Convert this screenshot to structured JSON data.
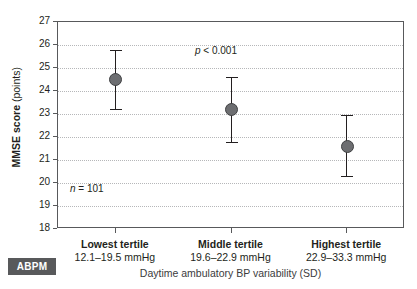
{
  "chart_data": {
    "type": "scatter",
    "title": "",
    "xlabel": "Daytime ambulatory BP variability (SD)",
    "ylabel_strong": "MMSE score",
    "ylabel_light": "(points)",
    "ylabel_full": "MMSE score (points)",
    "ylim": [
      18,
      27
    ],
    "yticks": [
      27,
      26,
      25,
      24,
      23,
      22,
      21,
      20,
      19,
      18
    ],
    "grid": true,
    "legend": "none",
    "categories": [
      "Lowest tertile",
      "Middle tertile",
      "Highest tertile"
    ],
    "category_ranges": [
      "12.1–19.5 mmHg",
      "19.6–22.9 mmHg",
      "22.9–33.3 mmHg"
    ],
    "series": [
      {
        "name": "MMSE score",
        "values": [
          24.5,
          23.2,
          21.6
        ],
        "ci_lower": [
          23.2,
          21.8,
          20.3
        ],
        "ci_upper": [
          25.8,
          24.6,
          22.95
        ],
        "marker": "filled-circle",
        "color": "#6d6e71"
      }
    ],
    "annotations": [
      {
        "id": "pvalue",
        "text_italic": "p",
        "text_rest": " < 0.001"
      },
      {
        "id": "sample-size",
        "text_italic": "n",
        "text_rest": " = 101"
      }
    ]
  },
  "badge": {
    "label": "ABPM",
    "background": "#58595b",
    "text_color": "#ffffff"
  },
  "colors": {
    "marker": "#6d6e71",
    "marker_edge": "#3f4042",
    "axis": "#58595b",
    "grid": "#b6b7b9",
    "text": "#231f20",
    "axis_title": "#3b3b3d"
  }
}
